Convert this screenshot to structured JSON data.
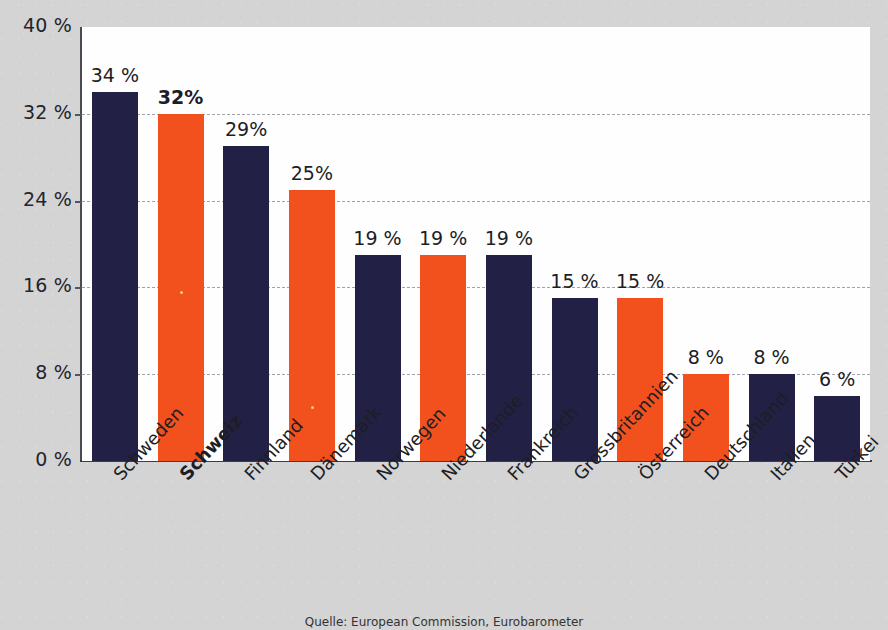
{
  "chart_data": {
    "type": "bar",
    "title": "",
    "xlabel": "",
    "ylabel": "",
    "categories": [
      "Schweden",
      "Schweiz",
      "Finnland",
      "Dänemark",
      "Norwegen",
      "Niederlande",
      "Frankreich",
      "Grossbritannien",
      "Österreich",
      "Deutschland",
      "Italien",
      "Türkei"
    ],
    "values": [
      34,
      32,
      29,
      25,
      19,
      19,
      19,
      15,
      15,
      8,
      8,
      6
    ],
    "value_labels": [
      "34 %",
      "32%",
      "29%",
      "25%",
      "19 %",
      "19 %",
      "19 %",
      "15 %",
      "15 %",
      "8 %",
      "8 %",
      "6 %"
    ],
    "bar_colors": [
      "navy",
      "orange",
      "navy",
      "orange",
      "navy",
      "orange",
      "navy",
      "navy",
      "orange",
      "orange",
      "navy",
      "navy"
    ],
    "highlight_index": 1,
    "ylim": [
      0,
      40
    ],
    "yticks": [
      0,
      8,
      16,
      24,
      32,
      40
    ],
    "ytick_labels": [
      "0 %",
      "8 %",
      "16 %",
      "24 %",
      "32 %",
      "40 %"
    ],
    "grid": true,
    "grid_style": "dashed-horizontal",
    "legend": "none",
    "colors": {
      "navy": "#232046",
      "orange": "#f2511e",
      "plot_background": "#fefefe",
      "page_background": "#d4d4d4",
      "gridline": "#9fa3ae",
      "axis": "#3c3c44",
      "text": "#1d1d25"
    }
  },
  "source_note": "Quelle: European Commission, Eurobarometer"
}
